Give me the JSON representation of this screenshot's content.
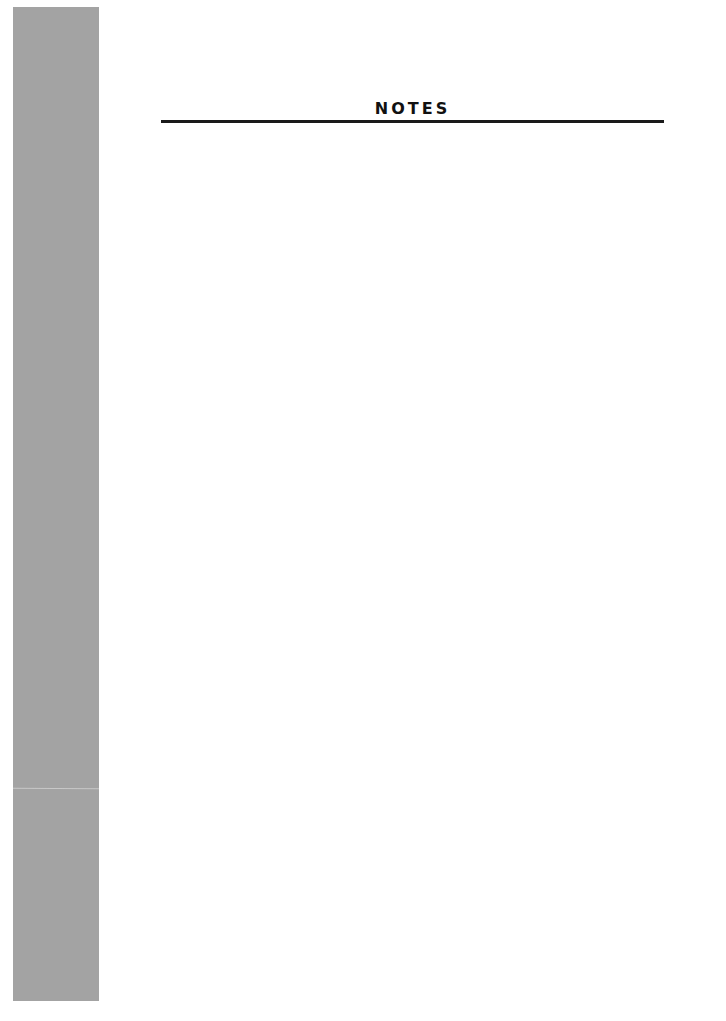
{
  "page": {
    "title": "NOTES",
    "body_lines": []
  },
  "colors": {
    "side_bar": "#a3a3a3",
    "rule": "#1a1a1a",
    "title": "#111111",
    "background": "#ffffff"
  }
}
